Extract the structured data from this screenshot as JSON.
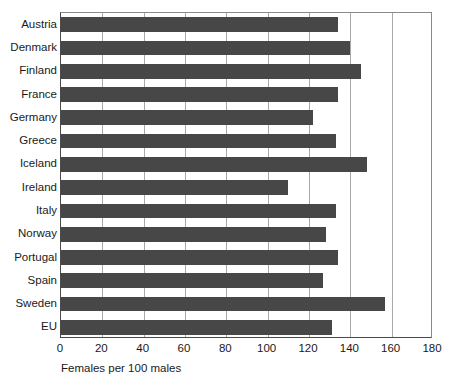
{
  "chart_data": {
    "type": "bar",
    "orientation": "horizontal",
    "title": "",
    "subtitle": "",
    "xlabel": "Females per 100 males",
    "ylabel": "",
    "xlim": [
      0,
      180
    ],
    "xticks": [
      0,
      20,
      40,
      60,
      80,
      100,
      120,
      140,
      160,
      180
    ],
    "xtick_labels": [
      "0",
      "20",
      "40",
      "60",
      "80",
      "100",
      "120",
      "140",
      "160",
      "180"
    ],
    "grid": "vertical",
    "legend": "none",
    "bar_color": "#474747",
    "gridline_color": "#a9a9a9",
    "axis_color": "#4a4a4a",
    "background_color": "#ffffff",
    "categories": [
      "Austria",
      "Denmark",
      "Finland",
      "France",
      "Germany",
      "Greece",
      "Iceland",
      "Ireland",
      "Italy",
      "Norway",
      "Portugal",
      "Spain",
      "Sweden",
      "EU"
    ],
    "values": [
      134,
      140,
      145,
      134,
      122,
      133,
      148,
      110,
      133,
      128,
      134,
      127,
      157,
      131
    ]
  }
}
